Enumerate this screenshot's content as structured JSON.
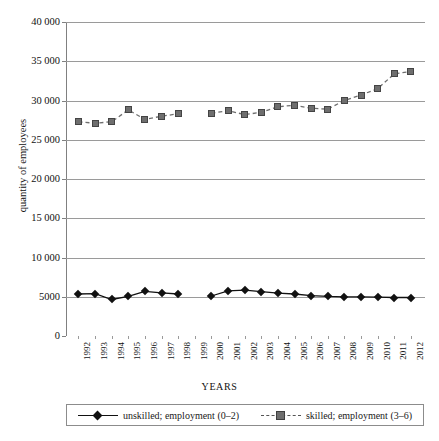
{
  "chart_data": {
    "type": "line",
    "title": "",
    "xlabel": "YEARS",
    "ylabel": "quantity of employees",
    "ylim": [
      0,
      40000
    ],
    "ytick_values": [
      0,
      5000,
      10000,
      15000,
      20000,
      25000,
      30000,
      35000,
      40000
    ],
    "ytick_labels": [
      "0",
      "5000",
      "10 000",
      "15 000",
      "20 000",
      "25 000",
      "30 000",
      "35 000",
      "40 000"
    ],
    "grid": true,
    "legend_position": "bottom",
    "categories": [
      "1992",
      "1993",
      "1994",
      "1995",
      "1996",
      "1997",
      "1998",
      "1999",
      "2000",
      "2001",
      "2002",
      "2003",
      "2004",
      "2005",
      "2006",
      "2007",
      "2008",
      "2009",
      "2010",
      "2011",
      "2012"
    ],
    "series": [
      {
        "name": "unskilled; employment (0–2)",
        "marker": "diamond",
        "line_style": "solid",
        "color": "#111111",
        "values": [
          5350,
          5400,
          4650,
          5050,
          5700,
          5500,
          5350,
          null,
          5100,
          5750,
          5850,
          5650,
          5450,
          5350,
          5150,
          5050,
          5000,
          5000,
          4950,
          4900,
          4900
        ]
      },
      {
        "name": "skilled; employment (3–6)",
        "marker": "square",
        "line_style": "dashed",
        "color": "#6e6e6e",
        "values": [
          27300,
          27100,
          27300,
          28800,
          27600,
          28000,
          28300,
          null,
          28400,
          28700,
          28200,
          28500,
          29200,
          29400,
          29000,
          28900,
          30000,
          30700,
          31500,
          33400,
          33700
        ]
      }
    ]
  },
  "axes": {
    "y_title": "quantity of employees",
    "x_title": "YEARS"
  },
  "legend": {
    "entries": [
      {
        "label": "unskilled; employment (0–2)",
        "marker": "diamond-marker-icon",
        "color": "#111111"
      },
      {
        "label": "skilled; employment (3–6)",
        "marker": "square-marker-icon",
        "color": "#6e6e6e"
      }
    ]
  }
}
